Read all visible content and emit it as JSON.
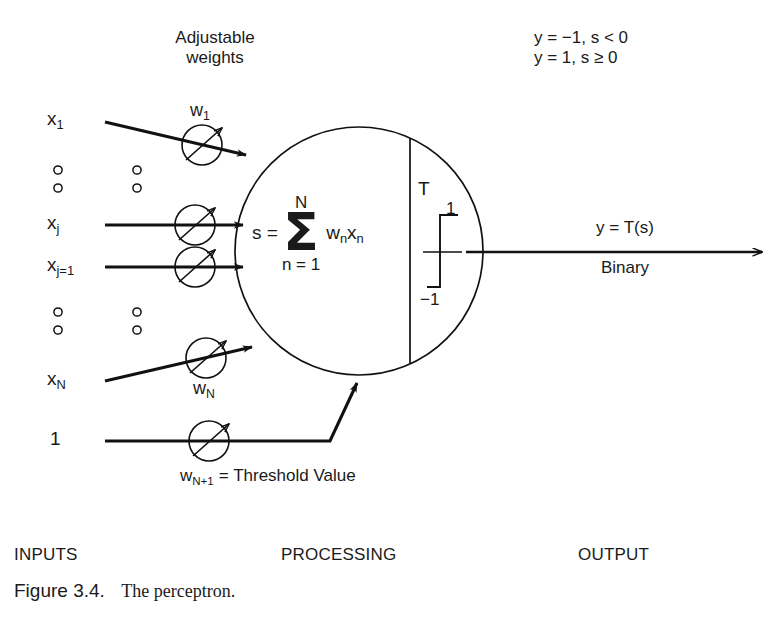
{
  "figure": {
    "heading_weights_line1": "Adjustable",
    "heading_weights_line2": "weights",
    "activation_rule_line1": "y = −1, s < 0",
    "activation_rule_line2": "y = 1, s ≥ 0",
    "inputs": [
      {
        "name": "x1",
        "base": "x",
        "subscript": "1",
        "weight_base": "w",
        "weight_subscript": "1"
      },
      {
        "name": "xj",
        "base": "x",
        "subscript": "j",
        "weight_base": "",
        "weight_subscript": ""
      },
      {
        "name": "xj1",
        "base": "x",
        "subscript": "j=1",
        "weight_base": "",
        "weight_subscript": ""
      },
      {
        "name": "xN",
        "base": "x",
        "subscript": "N",
        "weight_base": "w",
        "weight_subscript": "N"
      }
    ],
    "bias_input_label": "1",
    "bias_weight_label": "w",
    "bias_weight_subscript": "N+1",
    "bias_weight_equation": "= Threshold Value",
    "summation": {
      "lhs": "s =",
      "upper_limit": "N",
      "glyph": "Σ",
      "lower_limit": "n = 1",
      "term_base_w": "w",
      "term_sub_w": "n",
      "term_base_x": "x",
      "term_sub_x": "n"
    },
    "threshold": {
      "function_label": "T",
      "high_level": "1",
      "low_level": "−1"
    },
    "output": {
      "equation": "y = T(s)",
      "type": "Binary"
    },
    "sections": {
      "inputs": "INPUTS",
      "processing": "PROCESSING",
      "output": "OUTPUT"
    },
    "caption": {
      "number": "Figure 3.4.",
      "text": "The perceptron."
    },
    "colors": {
      "ink": "#1a1a1a",
      "line": "#111111",
      "background": "#ffffff"
    }
  }
}
